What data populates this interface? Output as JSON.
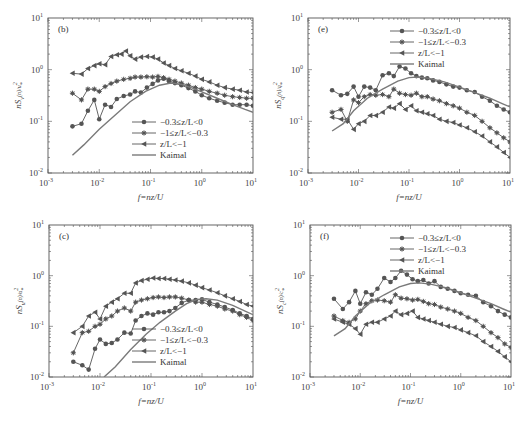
{
  "figure": {
    "x_label": "f=nz/U",
    "x_ticks": [
      "10-3",
      "10-2",
      "10-1",
      "100",
      "101"
    ],
    "y_ticks": [
      "10-2",
      "10-1",
      "100",
      "101"
    ]
  },
  "legend": {
    "series": [
      {
        "name": "−0.3≤z/L<0",
        "marker": "circle"
      },
      {
        "name": "−1≤z/L<−0.3",
        "marker": "asterisk"
      },
      {
        "name": "z/L<−1",
        "marker": "left-triangle"
      },
      {
        "name": "Kaimal",
        "marker": "none"
      }
    ]
  },
  "colors": {
    "series": "#555555",
    "kaimal": "#7a7a7a",
    "axis": "#555555"
  },
  "chart_data": [
    {
      "panel": "(b)",
      "type": "line",
      "title": "",
      "xlabel": "f=nz/U",
      "ylabel": "nSv(n)/u*²",
      "xscale": "log",
      "yscale": "log",
      "xlim": [
        0.001,
        10
      ],
      "ylim": [
        0.01,
        10
      ],
      "legend_position": "lower right",
      "series": [
        {
          "name": "−0.3≤z/L<0",
          "x": [
            0.003,
            0.0045,
            0.006,
            0.008,
            0.01,
            0.013,
            0.017,
            0.022,
            0.03,
            0.04,
            0.05,
            0.065,
            0.085,
            0.11,
            0.14,
            0.18,
            0.23,
            0.3,
            0.4,
            0.55,
            0.75,
            1,
            1.4,
            2,
            2.8,
            4,
            5.5,
            7.5,
            10
          ],
          "y": [
            0.08,
            0.09,
            0.16,
            0.26,
            0.11,
            0.21,
            0.19,
            0.27,
            0.31,
            0.33,
            0.38,
            0.36,
            0.45,
            0.53,
            0.62,
            0.67,
            0.6,
            0.55,
            0.5,
            0.44,
            0.38,
            0.32,
            0.28,
            0.25,
            0.23,
            0.21,
            0.21,
            0.21,
            0.2
          ]
        },
        {
          "name": "−1≤z/L<−0.3",
          "x": [
            0.003,
            0.0045,
            0.006,
            0.008,
            0.01,
            0.013,
            0.017,
            0.022,
            0.03,
            0.04,
            0.05,
            0.065,
            0.085,
            0.11,
            0.14,
            0.18,
            0.23,
            0.3,
            0.4,
            0.55,
            0.75,
            1,
            1.4,
            2,
            2.8,
            4,
            5.5,
            7.5,
            10
          ],
          "y": [
            0.35,
            0.26,
            0.42,
            0.42,
            0.38,
            0.47,
            0.54,
            0.6,
            0.65,
            0.68,
            0.72,
            0.72,
            0.73,
            0.72,
            0.74,
            0.7,
            0.65,
            0.6,
            0.55,
            0.5,
            0.45,
            0.42,
            0.38,
            0.35,
            0.32,
            0.3,
            0.29,
            0.28,
            0.28
          ]
        },
        {
          "name": "z/L<−1",
          "x": [
            0.003,
            0.0045,
            0.006,
            0.008,
            0.01,
            0.013,
            0.017,
            0.022,
            0.027,
            0.033,
            0.04,
            0.05,
            0.065,
            0.085,
            0.11,
            0.14,
            0.18,
            0.23,
            0.3,
            0.4,
            0.55,
            0.75,
            1,
            1.4,
            2,
            2.8,
            4,
            5.5,
            7.5,
            10
          ],
          "y": [
            0.85,
            0.82,
            1.05,
            1.2,
            1.3,
            1.25,
            1.8,
            1.95,
            2.0,
            2.3,
            1.85,
            1.6,
            1.75,
            1.8,
            1.75,
            1.6,
            1.35,
            1.2,
            1.05,
            0.95,
            0.85,
            0.75,
            0.65,
            0.58,
            0.5,
            0.45,
            0.42,
            0.4,
            0.37,
            0.36
          ]
        },
        {
          "name": "Kaimal",
          "x": [
            0.003,
            0.005,
            0.01,
            0.02,
            0.04,
            0.08,
            0.15,
            0.25,
            0.4,
            0.7,
            1,
            2,
            4,
            7,
            10
          ],
          "y": [
            0.022,
            0.035,
            0.07,
            0.13,
            0.24,
            0.38,
            0.5,
            0.55,
            0.52,
            0.43,
            0.37,
            0.28,
            0.21,
            0.17,
            0.15
          ]
        }
      ]
    },
    {
      "panel": "(e)",
      "type": "line",
      "title": "",
      "xlabel": "f=nz/U",
      "ylabel": "nSq(n)/q*²",
      "xscale": "log",
      "yscale": "log",
      "xlim": [
        0.001,
        10
      ],
      "ylim": [
        0.01,
        10
      ],
      "legend_position": "upper right",
      "series": [
        {
          "name": "−0.3≤z/L<0",
          "x": [
            0.003,
            0.0045,
            0.006,
            0.008,
            0.01,
            0.013,
            0.017,
            0.022,
            0.03,
            0.04,
            0.05,
            0.065,
            0.085,
            0.11,
            0.14,
            0.18,
            0.23,
            0.3,
            0.4,
            0.55,
            0.75,
            1,
            1.4,
            2,
            2.8,
            4,
            5.5,
            7.5,
            10
          ],
          "y": [
            0.4,
            0.32,
            0.34,
            0.47,
            0.3,
            0.47,
            0.45,
            0.4,
            0.78,
            0.85,
            0.75,
            1.15,
            1.05,
            0.85,
            0.75,
            0.7,
            0.68,
            0.62,
            0.58,
            0.52,
            0.47,
            0.45,
            0.4,
            0.37,
            0.3,
            0.25,
            0.2,
            0.17,
            0.15
          ]
        },
        {
          "name": "−1≤z/L<−0.3",
          "x": [
            0.003,
            0.0045,
            0.006,
            0.008,
            0.01,
            0.013,
            0.017,
            0.022,
            0.03,
            0.04,
            0.05,
            0.065,
            0.085,
            0.11,
            0.14,
            0.18,
            0.23,
            0.3,
            0.4,
            0.55,
            0.75,
            1,
            1.4,
            2,
            2.8,
            4,
            5.5,
            7.5,
            10
          ],
          "y": [
            0.15,
            0.17,
            0.1,
            0.26,
            0.23,
            0.3,
            0.33,
            0.32,
            0.33,
            0.3,
            0.42,
            0.35,
            0.33,
            0.32,
            0.35,
            0.3,
            0.3,
            0.27,
            0.25,
            0.22,
            0.2,
            0.18,
            0.15,
            0.13,
            0.1,
            0.075,
            0.06,
            0.048,
            0.04
          ]
        },
        {
          "name": "z/L<−1",
          "x": [
            0.003,
            0.0045,
            0.006,
            0.008,
            0.01,
            0.013,
            0.017,
            0.022,
            0.03,
            0.04,
            0.05,
            0.065,
            0.085,
            0.11,
            0.14,
            0.18,
            0.23,
            0.3,
            0.4,
            0.55,
            0.75,
            1,
            1.4,
            2,
            2.8,
            4,
            5.5,
            7.5,
            10
          ],
          "y": [
            0.12,
            0.11,
            0.11,
            0.07,
            0.09,
            0.1,
            0.13,
            0.13,
            0.15,
            0.19,
            0.18,
            0.22,
            0.17,
            0.2,
            0.16,
            0.15,
            0.14,
            0.13,
            0.11,
            0.1,
            0.095,
            0.085,
            0.075,
            0.063,
            0.052,
            0.04,
            0.032,
            0.025,
            0.02
          ]
        },
        {
          "name": "Kaimal",
          "x": [
            0.003,
            0.005,
            0.008,
            0.015,
            0.03,
            0.06,
            0.1,
            0.15,
            0.25,
            0.5,
            1,
            2,
            4,
            7,
            10
          ],
          "y": [
            0.065,
            0.09,
            0.16,
            0.28,
            0.42,
            0.6,
            0.7,
            0.72,
            0.68,
            0.58,
            0.46,
            0.36,
            0.28,
            0.22,
            0.19
          ]
        }
      ]
    },
    {
      "panel": "(c)",
      "type": "line",
      "title": "",
      "xlabel": "f=nz/U",
      "ylabel": "nSu(n)/u*²",
      "xscale": "log",
      "yscale": "log",
      "xlim": [
        0.001,
        10
      ],
      "ylim": [
        0.01,
        10
      ],
      "legend_position": "lower right",
      "series": [
        {
          "name": "−0.3≤z/L<0",
          "x": [
            0.003,
            0.0045,
            0.006,
            0.008,
            0.01,
            0.013,
            0.017,
            0.022,
            0.03,
            0.04,
            0.05,
            0.065,
            0.085,
            0.11,
            0.14,
            0.18,
            0.23,
            0.3,
            0.4,
            0.55,
            0.75,
            1,
            1.4,
            2,
            2.8,
            4,
            5.5,
            7.5,
            10
          ],
          "y": [
            0.02,
            0.017,
            0.014,
            0.036,
            0.055,
            0.045,
            0.047,
            0.055,
            0.075,
            0.072,
            0.13,
            0.16,
            0.18,
            0.17,
            0.19,
            0.19,
            0.2,
            0.23,
            0.29,
            0.33,
            0.33,
            0.34,
            0.3,
            0.27,
            0.24,
            0.21,
            0.18,
            0.16,
            0.14
          ]
        },
        {
          "name": "−1≤z/L<−0.3",
          "x": [
            0.003,
            0.0045,
            0.006,
            0.008,
            0.01,
            0.013,
            0.017,
            0.022,
            0.03,
            0.04,
            0.05,
            0.065,
            0.085,
            0.11,
            0.14,
            0.18,
            0.23,
            0.3,
            0.4,
            0.55,
            0.75,
            1,
            1.4,
            2,
            2.8,
            4,
            5.5,
            7.5,
            10
          ],
          "y": [
            0.03,
            0.075,
            0.08,
            0.1,
            0.11,
            0.14,
            0.16,
            0.2,
            0.23,
            0.2,
            0.3,
            0.33,
            0.35,
            0.37,
            0.38,
            0.37,
            0.38,
            0.38,
            0.36,
            0.33,
            0.3,
            0.3,
            0.27,
            0.25,
            0.22,
            0.2,
            0.17,
            0.15,
            0.13
          ]
        },
        {
          "name": "z/L<−1",
          "x": [
            0.003,
            0.0045,
            0.006,
            0.008,
            0.01,
            0.013,
            0.017,
            0.022,
            0.03,
            0.04,
            0.05,
            0.065,
            0.085,
            0.11,
            0.14,
            0.18,
            0.23,
            0.3,
            0.4,
            0.55,
            0.75,
            1,
            1.4,
            2,
            2.8,
            4,
            5.5,
            7.5,
            10
          ],
          "y": [
            0.075,
            0.1,
            0.16,
            0.19,
            0.14,
            0.25,
            0.3,
            0.35,
            0.45,
            0.45,
            0.72,
            0.8,
            0.85,
            0.9,
            0.88,
            0.88,
            0.85,
            0.82,
            0.78,
            0.72,
            0.65,
            0.58,
            0.52,
            0.46,
            0.4,
            0.35,
            0.31,
            0.27,
            0.25
          ]
        },
        {
          "name": "Kaimal",
          "x": [
            0.012,
            0.02,
            0.04,
            0.08,
            0.15,
            0.3,
            0.5,
            0.8,
            1.2,
            2,
            4,
            7,
            10
          ],
          "y": [
            0.01,
            0.016,
            0.035,
            0.07,
            0.12,
            0.2,
            0.28,
            0.34,
            0.35,
            0.33,
            0.26,
            0.2,
            0.17
          ]
        }
      ]
    },
    {
      "panel": "(f)",
      "type": "line",
      "title": "",
      "xlabel": "f=nz/U",
      "ylabel": "nSc(n)/c*²",
      "xscale": "log",
      "yscale": "log",
      "xlim": [
        0.001,
        10
      ],
      "ylim": [
        0.01,
        10
      ],
      "legend_position": "upper right",
      "series": [
        {
          "name": "−0.3≤z/L<0",
          "x": [
            0.003,
            0.0045,
            0.006,
            0.008,
            0.01,
            0.013,
            0.017,
            0.022,
            0.03,
            0.04,
            0.05,
            0.065,
            0.085,
            0.11,
            0.14,
            0.18,
            0.23,
            0.3,
            0.4,
            0.55,
            0.75,
            1,
            1.4,
            2,
            2.8,
            4,
            5.5,
            7.5,
            10
          ],
          "y": [
            0.35,
            0.22,
            0.3,
            0.5,
            0.28,
            0.47,
            0.42,
            0.55,
            0.9,
            0.75,
            0.9,
            1.25,
            1.05,
            0.85,
            0.78,
            0.82,
            0.7,
            0.78,
            0.6,
            0.55,
            0.5,
            0.45,
            0.42,
            0.4,
            0.3,
            0.25,
            0.2,
            0.17,
            0.15
          ]
        },
        {
          "name": "−1≤z/L<−0.3",
          "x": [
            0.003,
            0.0045,
            0.006,
            0.008,
            0.01,
            0.013,
            0.017,
            0.022,
            0.03,
            0.04,
            0.05,
            0.065,
            0.085,
            0.11,
            0.14,
            0.18,
            0.23,
            0.3,
            0.4,
            0.55,
            0.75,
            1,
            1.4,
            2,
            2.8,
            4,
            5.5,
            7.5,
            10
          ],
          "y": [
            0.16,
            0.13,
            0.12,
            0.14,
            0.2,
            0.28,
            0.32,
            0.33,
            0.32,
            0.3,
            0.42,
            0.36,
            0.35,
            0.33,
            0.34,
            0.31,
            0.28,
            0.27,
            0.24,
            0.22,
            0.2,
            0.18,
            0.15,
            0.13,
            0.1,
            0.075,
            0.06,
            0.045,
            0.038
          ]
        },
        {
          "name": "z/L<−1",
          "x": [
            0.003,
            0.0045,
            0.006,
            0.008,
            0.01,
            0.013,
            0.017,
            0.022,
            0.03,
            0.04,
            0.05,
            0.065,
            0.085,
            0.11,
            0.14,
            0.18,
            0.23,
            0.3,
            0.4,
            0.55,
            0.75,
            1,
            1.4,
            2,
            2.8,
            4,
            5.5,
            7.5,
            10
          ],
          "y": [
            0.14,
            0.12,
            0.11,
            0.09,
            0.07,
            0.11,
            0.12,
            0.12,
            0.14,
            0.16,
            0.2,
            0.17,
            0.18,
            0.2,
            0.15,
            0.14,
            0.13,
            0.12,
            0.11,
            0.1,
            0.095,
            0.085,
            0.075,
            0.065,
            0.05,
            0.04,
            0.032,
            0.025,
            0.02
          ]
        },
        {
          "name": "Kaimal",
          "x": [
            0.003,
            0.005,
            0.008,
            0.015,
            0.03,
            0.06,
            0.1,
            0.15,
            0.25,
            0.5,
            1,
            2,
            4,
            7,
            10
          ],
          "y": [
            0.065,
            0.09,
            0.16,
            0.28,
            0.42,
            0.6,
            0.7,
            0.72,
            0.68,
            0.58,
            0.46,
            0.36,
            0.28,
            0.22,
            0.19
          ]
        }
      ]
    }
  ],
  "panels_layout": [
    {
      "tag": "(b)",
      "ylabel_main": "nS",
      "ylabel_sub": "v",
      "ylabel_tail": "(n)/u",
      "ylabel_sq": "*",
      "left": 48,
      "top": 18,
      "right": 253,
      "bottom": 173,
      "legend": {
        "x": 160,
        "y": 122
      }
    },
    {
      "tag": "(e)",
      "ylabel_main": "nS",
      "ylabel_sub": "q",
      "ylabel_tail": "(n)/q",
      "ylabel_sq": "*",
      "left": 308,
      "top": 18,
      "right": 510,
      "bottom": 173,
      "legend": {
        "x": 418,
        "y": 31
      }
    },
    {
      "tag": "(c)",
      "ylabel_main": "nS",
      "ylabel_sub": "u",
      "ylabel_tail": "(n)/u",
      "ylabel_sq": "*",
      "left": 49,
      "top": 225,
      "right": 253,
      "bottom": 377,
      "legend": {
        "x": 160,
        "y": 329
      }
    },
    {
      "tag": "(f)",
      "ylabel_main": "nS",
      "ylabel_sub": "c",
      "ylabel_tail": "(n)/c",
      "ylabel_sq": "*",
      "left": 310,
      "top": 225,
      "right": 511,
      "bottom": 377,
      "legend": {
        "x": 418,
        "y": 238
      }
    }
  ]
}
